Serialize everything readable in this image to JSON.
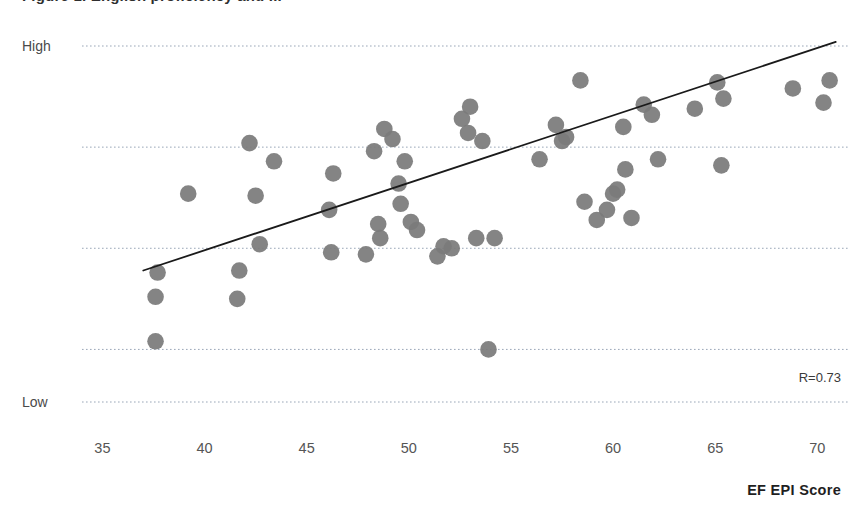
{
  "title": "Figure 1. English proficiency and ...",
  "axes": {
    "y_high_label": "High",
    "y_low_label": "Low",
    "x_title": "EF EPI Score",
    "x_ticks": [
      "35",
      "40",
      "45",
      "50",
      "55",
      "60",
      "65",
      "70"
    ]
  },
  "annotation": {
    "correlation": "R=0.73"
  },
  "colors": {
    "point": "#7b7b7b",
    "trendline": "#1a1a1a",
    "gridline": "#9aa7b8",
    "tick_text": "#555555",
    "title_text": "#2f2f2f"
  },
  "chart_data": {
    "type": "scatter",
    "title": "Figure 1. English proficiency and ...",
    "xlabel": "EF EPI Score",
    "ylabel": "",
    "xlim": [
      34.0,
      71.5
    ],
    "ylim": [
      0,
      100
    ],
    "ytick_labels": [
      "Low",
      "High"
    ],
    "ytick_values": [
      6,
      94
    ],
    "xtick_values": [
      35,
      40,
      45,
      50,
      55,
      60,
      65,
      70
    ],
    "grid": true,
    "gridlines_y": [
      94,
      69,
      44,
      19,
      6
    ],
    "legend": "none",
    "annotations": [
      {
        "text": "R=0.73",
        "x": 69.5,
        "y": 14
      }
    ],
    "trendline": {
      "type": "linear",
      "x_start": 37.0,
      "y_start": 38.5,
      "x_end": 70.9,
      "y_end": 95.0
    },
    "points": [
      {
        "x": 37.6,
        "y": 21.0
      },
      {
        "x": 37.6,
        "y": 32.0
      },
      {
        "x": 37.7,
        "y": 38.0
      },
      {
        "x": 39.2,
        "y": 57.5
      },
      {
        "x": 41.6,
        "y": 31.5
      },
      {
        "x": 41.7,
        "y": 38.5
      },
      {
        "x": 42.2,
        "y": 70.0
      },
      {
        "x": 42.5,
        "y": 57.0
      },
      {
        "x": 42.7,
        "y": 45.0
      },
      {
        "x": 43.4,
        "y": 65.5
      },
      {
        "x": 46.1,
        "y": 53.5
      },
      {
        "x": 46.2,
        "y": 43.0
      },
      {
        "x": 46.3,
        "y": 62.5
      },
      {
        "x": 47.9,
        "y": 42.5
      },
      {
        "x": 48.3,
        "y": 68.0
      },
      {
        "x": 48.5,
        "y": 50.0
      },
      {
        "x": 48.6,
        "y": 46.5
      },
      {
        "x": 48.8,
        "y": 73.5
      },
      {
        "x": 49.2,
        "y": 71.0
      },
      {
        "x": 49.5,
        "y": 60.0
      },
      {
        "x": 49.6,
        "y": 55.0
      },
      {
        "x": 49.8,
        "y": 65.5
      },
      {
        "x": 50.1,
        "y": 50.5
      },
      {
        "x": 50.4,
        "y": 48.5
      },
      {
        "x": 51.4,
        "y": 42.0
      },
      {
        "x": 51.7,
        "y": 44.5
      },
      {
        "x": 52.1,
        "y": 44.0
      },
      {
        "x": 52.6,
        "y": 76.0
      },
      {
        "x": 52.9,
        "y": 72.5
      },
      {
        "x": 53.0,
        "y": 79.0
      },
      {
        "x": 53.3,
        "y": 46.5
      },
      {
        "x": 53.6,
        "y": 70.5
      },
      {
        "x": 53.9,
        "y": 19.0
      },
      {
        "x": 54.2,
        "y": 46.5
      },
      {
        "x": 56.4,
        "y": 66.0
      },
      {
        "x": 57.2,
        "y": 74.5
      },
      {
        "x": 57.5,
        "y": 70.5
      },
      {
        "x": 57.7,
        "y": 71.5
      },
      {
        "x": 58.4,
        "y": 85.5
      },
      {
        "x": 58.6,
        "y": 55.5
      },
      {
        "x": 59.2,
        "y": 51.0
      },
      {
        "x": 59.7,
        "y": 53.5
      },
      {
        "x": 60.0,
        "y": 57.5
      },
      {
        "x": 60.2,
        "y": 58.5
      },
      {
        "x": 60.5,
        "y": 74.0
      },
      {
        "x": 60.6,
        "y": 63.5
      },
      {
        "x": 60.9,
        "y": 51.5
      },
      {
        "x": 61.5,
        "y": 79.5
      },
      {
        "x": 61.9,
        "y": 77.0
      },
      {
        "x": 62.2,
        "y": 66.0
      },
      {
        "x": 64.0,
        "y": 78.5
      },
      {
        "x": 65.1,
        "y": 85.0
      },
      {
        "x": 65.3,
        "y": 64.5
      },
      {
        "x": 65.4,
        "y": 81.0
      },
      {
        "x": 68.8,
        "y": 83.5
      },
      {
        "x": 70.3,
        "y": 80.0
      },
      {
        "x": 70.6,
        "y": 85.5
      }
    ]
  }
}
